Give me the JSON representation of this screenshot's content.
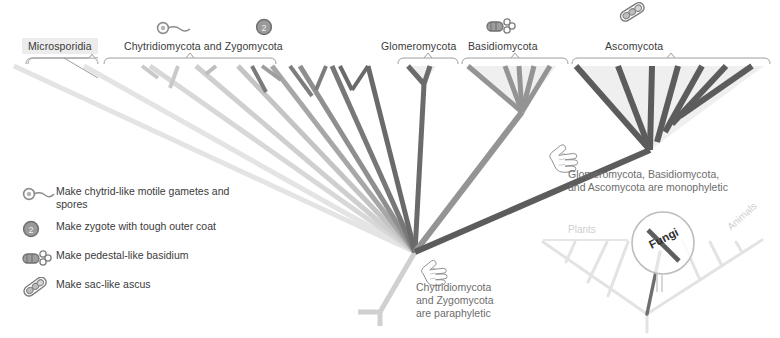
{
  "figure": {
    "type": "phylogenetic-tree"
  },
  "clades": [
    {
      "id": "microsporidia",
      "label": "Microsporidia",
      "highlighted": true,
      "label_x": 22,
      "label_y": 38
    },
    {
      "id": "chytrid-zygo",
      "label": "Chytridiomycota and Zygomycota",
      "highlighted": false,
      "label_x": 124,
      "label_y": 40
    },
    {
      "id": "glomeromycota",
      "label": "Glomeromycota",
      "highlighted": false,
      "label_x": 381,
      "label_y": 40
    },
    {
      "id": "basidiomycota",
      "label": "Basidiomycota",
      "highlighted": false,
      "label_x": 468,
      "label_y": 40
    },
    {
      "id": "ascomycota",
      "label": "Ascomycota",
      "highlighted": false,
      "label_x": 605,
      "label_y": 40
    }
  ],
  "trait_markers": [
    {
      "id": "motile-gametes",
      "icon": "flagellated-cell-icon",
      "x": 157,
      "y": 20
    },
    {
      "id": "zygote-coat",
      "icon": "zygote-two-icon",
      "x": 256,
      "y": 18
    },
    {
      "id": "basidium",
      "icon": "basidium-icon",
      "x": 487,
      "y": 17
    },
    {
      "id": "ascus",
      "icon": "ascus-icon",
      "x": 617,
      "y": 12
    }
  ],
  "legend": {
    "items": [
      {
        "icon": "flagellated-cell-icon",
        "text": "Make chytrid-like motile\ngametes and spores"
      },
      {
        "icon": "zygote-two-icon",
        "text": "Make zygote with tough outer coat"
      },
      {
        "icon": "basidium-icon",
        "text": "Make pedestal-like basidium"
      },
      {
        "icon": "ascus-icon",
        "text": "Make sac-like ascus"
      }
    ]
  },
  "annotations": [
    {
      "id": "monophyletic-note",
      "text": "Glomeromycota, Basidiomycota,\nand Ascomycota are monophyletic",
      "x": 568,
      "y": 170,
      "pointer": "hand-pointing-icon"
    },
    {
      "id": "paraphyletic-note",
      "text": "Chytridiomycota\nand Zygomycota\nare paraphyletic",
      "x": 416,
      "y": 283,
      "pointer": "hand-pointing-icon"
    }
  ],
  "inset": {
    "id": "eukaryote-overview",
    "magnifier_label": "Fungi",
    "labels": [
      {
        "id": "plants-label",
        "text": "Plants",
        "x": 568,
        "y": 224
      },
      {
        "id": "animals-label",
        "text": "Animals",
        "x": 725,
        "y": 224
      }
    ]
  },
  "colors": {
    "branch_dark": "#595959",
    "branch_mid": "#8a8a8a",
    "branch_light": "#c9c9c9",
    "branch_faint": "#e2e2e2",
    "bracket": "#9a9a9a",
    "label_bg": "#ececec",
    "text": "#3a3a3a",
    "annotation_text": "#6d6d6d",
    "inset_line": "#dedede"
  }
}
